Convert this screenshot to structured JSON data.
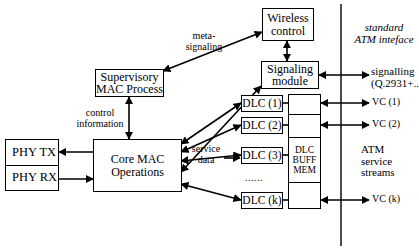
{
  "figure": {
    "type": "block-diagram",
    "width": 419,
    "height": 250,
    "line_color": "#000000",
    "background_color": "#ffffff"
  },
  "nodes": {
    "wireless_control": {
      "line1": "Wireless",
      "line2": "control"
    },
    "signaling_module": {
      "line1": "Signaling",
      "line2": "module"
    },
    "supervisory_mac": {
      "line1": "Supervisory",
      "line2": "MAC Process"
    },
    "core_mac": {
      "line1": "Core MAC",
      "line2": "Operations"
    },
    "phy": {
      "tx": "PHY TX",
      "rx": "PHY RX"
    },
    "dlc_buff_mem": {
      "line1": "DLC",
      "line2": "BUFF",
      "line3": "MEM"
    },
    "dlc_units": [
      {
        "label": "DLC (1)"
      },
      {
        "label": "DLC (2)"
      },
      {
        "label": "DLC (3)"
      },
      {
        "label": "DLC (k)"
      }
    ],
    "dlc_ellipsis": "......"
  },
  "edge_labels": {
    "meta_signaling": {
      "line1": "meta-",
      "line2": "signaling"
    },
    "control_information": {
      "line1": "control",
      "line2": "information"
    },
    "service_data": {
      "line1": "service",
      "line2": "data"
    }
  },
  "interface": {
    "boundary_caption": {
      "line1": "standard",
      "line2": "ATM inteface"
    },
    "signalling_port": {
      "line1": "signalling",
      "line2": "(Q.2931+..)"
    },
    "vc_ports": [
      {
        "label": "VC (1)"
      },
      {
        "label": "VC (2)"
      },
      {
        "label": "VC (k)"
      }
    ],
    "streams_caption": {
      "line1": "ATM",
      "line2": "service",
      "line3": "streams"
    }
  }
}
